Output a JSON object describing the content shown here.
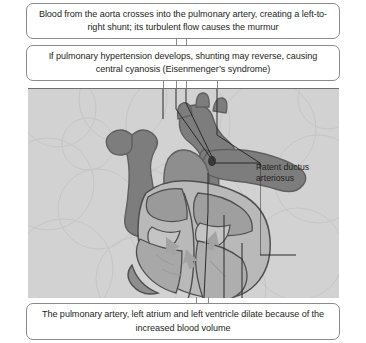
{
  "diagram": {
    "callouts": {
      "top": "Blood from the aorta crosses into the pulmonary artery, creating a left-to-right shunt; its turbulent flow causes the murmur",
      "middle": "If pulmonary hypertension develops, shunting may reverse, causing central cyanosis (Eisenmenger’s syndrome)",
      "bottom": "The pulmonary artery, left atrium and left ventricle dilate because of the increased blood volume"
    },
    "labels": {
      "pda_line1": "Patent ductus",
      "pda_line2": "arteriosus"
    },
    "colors": {
      "box_border": "#8a8a8a",
      "box_fill": "#ffffff",
      "text": "#231f20",
      "figure_background": "#d2d2d2",
      "vessel_dark": "#7d7d7d",
      "vessel_mid": "#9a9a9a",
      "chamber_light": "#b9b9b9",
      "outline": "#5f5f5f",
      "leader_line": "#2a2a2a"
    },
    "icons": {
      "connector": "vertical-connector-line",
      "leader": "leader-line"
    }
  }
}
